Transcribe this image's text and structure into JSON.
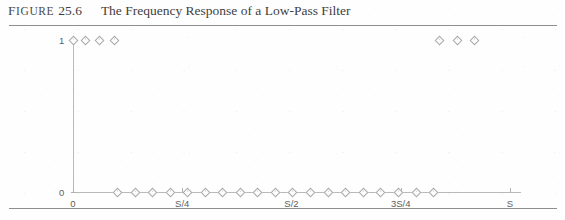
{
  "figure": {
    "label_word": "Figure",
    "number": "25.6",
    "title": "The Frequency Response of a Low-Pass Filter"
  },
  "colors": {
    "ink": "#3f3f3f",
    "axis": "#b9b9b9",
    "marker_stroke": "#a9a9a9",
    "rule": "#8e8e8e"
  },
  "chart_data": {
    "type": "scatter",
    "title": "The Frequency Response of a Low-Pass Filter",
    "xlabel": "",
    "ylabel": "",
    "grid": false,
    "legend": "none",
    "xlim": [
      0,
      1
    ],
    "ylim": [
      0,
      1
    ],
    "x_tick_labels": [
      "0",
      "S/4",
      "S/2",
      "3S/4",
      "S"
    ],
    "x_tick_values": [
      0,
      0.25,
      0.5,
      0.75,
      1
    ],
    "y_tick_labels": [
      "0",
      "1"
    ],
    "y_tick_values": [
      0,
      1
    ],
    "marker": "diamond",
    "series": [
      {
        "name": "Frequency response magnitude",
        "x": [
          0.0,
          0.027,
          0.06,
          0.094,
          0.1,
          0.141,
          0.181,
          0.221,
          0.261,
          0.301,
          0.341,
          0.382,
          0.422,
          0.462,
          0.502,
          0.542,
          0.583,
          0.623,
          0.663,
          0.703,
          0.743,
          0.784,
          0.824,
          0.838,
          0.878,
          0.918
        ],
        "y": [
          1.0,
          1.0,
          1.0,
          1.0,
          0.0,
          0.0,
          0.0,
          0.0,
          0.0,
          0.0,
          0.0,
          0.0,
          0.0,
          0.0,
          0.0,
          0.0,
          0.0,
          0.0,
          0.0,
          0.0,
          0.0,
          0.0,
          0.0,
          1.0,
          1.0,
          1.0
        ]
      }
    ]
  }
}
